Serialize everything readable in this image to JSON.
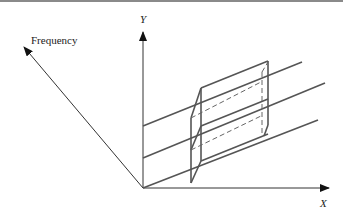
{
  "diagram": {
    "axes": {
      "x": {
        "label": "X"
      },
      "y": {
        "label": "Y"
      },
      "frequency": {
        "label": "Frequency"
      }
    },
    "colors": {
      "line": "#555555",
      "axis": "#333333",
      "background": "#ffffff"
    },
    "elements": [
      "three parallel sloped lines in X–Y plane",
      "3D prism / box spanning the lines with dashed hidden edges"
    ]
  }
}
